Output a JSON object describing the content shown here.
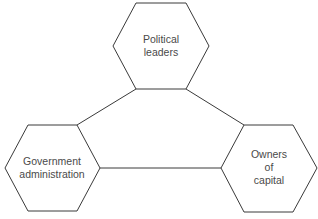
{
  "diagram": {
    "nodes": [
      {
        "id": "political-leaders",
        "lines": [
          "Political",
          "leaders"
        ]
      },
      {
        "id": "government-administration",
        "lines": [
          "Government",
          "administration"
        ]
      },
      {
        "id": "owners-of-capital",
        "lines": [
          "Owners",
          "of",
          "capital"
        ]
      }
    ],
    "edges": [
      {
        "from": "political-leaders",
        "to": "government-administration"
      },
      {
        "from": "political-leaders",
        "to": "owners-of-capital"
      },
      {
        "from": "government-administration",
        "to": "owners-of-capital"
      }
    ],
    "colors": {
      "stroke": "#3a3a3a",
      "text": "#4a4a4a",
      "background": "#ffffff"
    }
  }
}
